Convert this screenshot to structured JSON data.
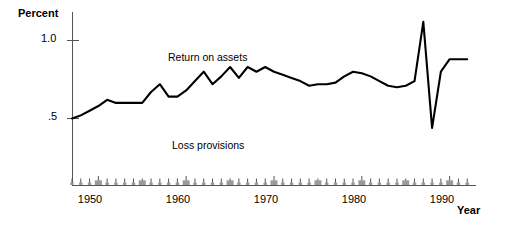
{
  "axes": {
    "y_title": "Percent",
    "x_title": "Year",
    "y_ticks": [
      {
        "value": 1.0,
        "label": "1.0"
      },
      {
        "value": 0.5,
        "label": ".5"
      }
    ],
    "x_ticks": [
      {
        "value": 1950,
        "label": "1950"
      },
      {
        "value": 1960,
        "label": "1960"
      },
      {
        "value": 1970,
        "label": "1970"
      },
      {
        "value": 1980,
        "label": "1980"
      },
      {
        "value": 1990,
        "label": "1990"
      }
    ]
  },
  "series_labels": {
    "return_on_assets": "Return on assets",
    "loss_provisions": "Loss provisions"
  },
  "colors": {
    "line": "#000000",
    "axis": "#555555",
    "bars": "#9a9a9a",
    "background": "#ffffff"
  },
  "chart_data": {
    "type": "line",
    "title": "",
    "subtitle": "",
    "xlabel": "Year",
    "ylabel": "Percent",
    "xlim": [
      1947,
      1993
    ],
    "ylim": [
      0,
      1.15
    ],
    "grid": false,
    "legend": "inline-annotation",
    "annotations": [
      {
        "text": "Return on assets",
        "x": 1961,
        "y": 0.88
      },
      {
        "text": "Loss provisions",
        "x": 1962,
        "y": 0.3
      }
    ],
    "series": [
      {
        "name": "Return on assets",
        "type": "line",
        "x": [
          1947,
          1948,
          1949,
          1950,
          1951,
          1952,
          1953,
          1954,
          1955,
          1956,
          1957,
          1958,
          1959,
          1960,
          1961,
          1962,
          1963,
          1964,
          1965,
          1966,
          1967,
          1968,
          1969,
          1970,
          1971,
          1972,
          1973,
          1974,
          1975,
          1976,
          1977,
          1978,
          1979,
          1980,
          1981,
          1982,
          1983,
          1984,
          1985,
          1986,
          1987,
          1988,
          1989,
          1990,
          1991,
          1992
        ],
        "values": [
          0.5,
          0.52,
          0.55,
          0.58,
          0.62,
          0.6,
          0.6,
          0.6,
          0.6,
          0.67,
          0.72,
          0.64,
          0.64,
          0.68,
          0.74,
          0.8,
          0.72,
          0.77,
          0.83,
          0.76,
          0.83,
          0.8,
          0.83,
          0.8,
          0.78,
          0.76,
          0.74,
          0.71,
          0.72,
          0.72,
          0.73,
          0.77,
          0.8,
          0.79,
          0.77,
          0.74,
          0.71,
          0.7,
          0.71,
          0.74,
          1.12,
          0.44,
          0.8,
          0.88,
          0.88,
          0.88
        ]
      },
      {
        "name": "Loss provisions",
        "type": "bar",
        "x": [
          1947,
          1948,
          1949,
          1950,
          1951,
          1952,
          1953,
          1954,
          1955,
          1956,
          1957,
          1958,
          1959,
          1960,
          1961,
          1962,
          1963,
          1964,
          1965,
          1966,
          1967,
          1968,
          1969,
          1970,
          1971,
          1972,
          1973,
          1974,
          1975,
          1976,
          1977,
          1978,
          1979,
          1980,
          1981,
          1982,
          1983,
          1984,
          1985,
          1986,
          1987,
          1988,
          1989,
          1990,
          1991,
          1992
        ],
        "values": [
          0.012,
          0.012,
          0.012,
          0.03,
          0.012,
          0.012,
          0.012,
          0.012,
          0.03,
          0.012,
          0.012,
          0.012,
          0.012,
          0.03,
          0.012,
          0.012,
          0.012,
          0.012,
          0.03,
          0.012,
          0.012,
          0.012,
          0.012,
          0.03,
          0.012,
          0.012,
          0.012,
          0.012,
          0.03,
          0.012,
          0.012,
          0.012,
          0.012,
          0.03,
          0.012,
          0.012,
          0.012,
          0.012,
          0.03,
          0.012,
          0.012,
          0.012,
          0.012,
          0.03,
          0.012,
          0.012
        ]
      }
    ]
  }
}
